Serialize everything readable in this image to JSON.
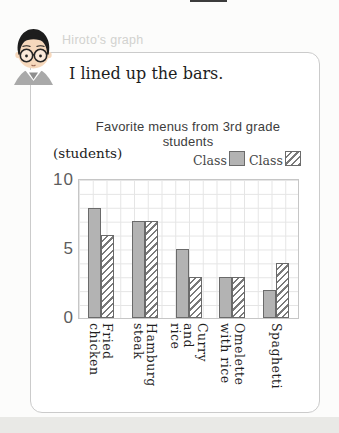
{
  "header": {
    "label": "Hiroto's graph"
  },
  "speech": {
    "text": "I lined up the bars."
  },
  "theme": {
    "card_border": "#cbcbcb",
    "bar_border": "#6a6a6a",
    "grid_color": "#e5e5e5",
    "class1_fill": "#b3b3b3",
    "class2_hatch": "#7a7a7a"
  },
  "chart_data": {
    "type": "bar",
    "title": "Favorite menus from 3rd grade students",
    "unit_label": "(students)",
    "categories": [
      "Fried\nchicken",
      "Hamburg\nsteak",
      "Curry and\nrice",
      "Omelette\nwith rice",
      "Spaghetti"
    ],
    "series": [
      {
        "name": "Class 1",
        "style": "solid",
        "color": "#b3b3b3",
        "values": [
          8,
          7,
          5,
          3,
          2
        ]
      },
      {
        "name": "Class 2",
        "style": "hatched",
        "color": "#7a7a7a",
        "values": [
          6,
          7,
          3,
          3,
          4
        ]
      }
    ],
    "ylim": [
      0,
      10
    ],
    "yticks": [
      10,
      5,
      0
    ],
    "grid": true,
    "legend_position": "top-right",
    "bars_adjacent": true
  }
}
